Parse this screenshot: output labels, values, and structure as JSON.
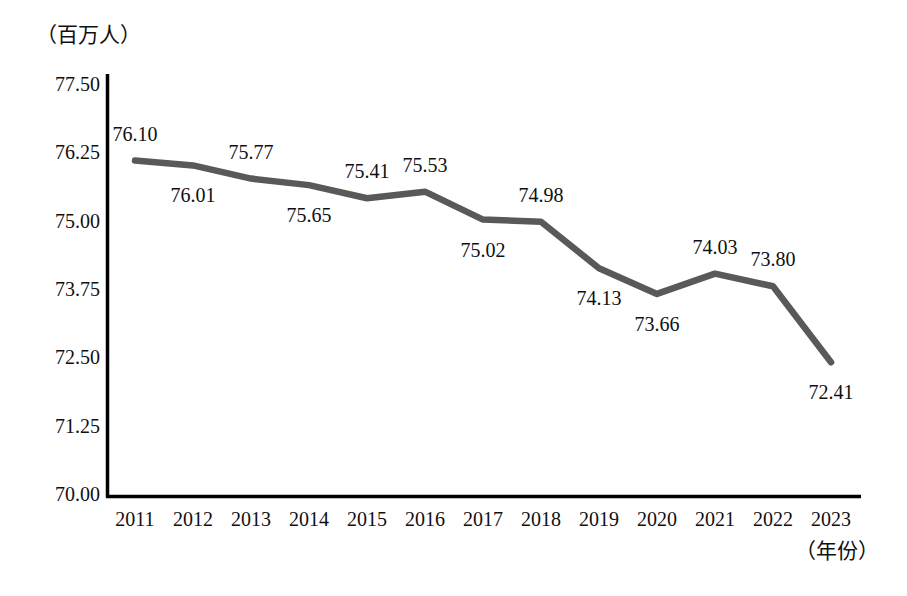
{
  "chart_data": {
    "type": "line",
    "title": "",
    "subtitle": "",
    "ylabel": "（百万人）",
    "xlabel": "（年份）",
    "categories": [
      "2011",
      "2012",
      "2013",
      "2014",
      "2015",
      "2016",
      "2017",
      "2018",
      "2019",
      "2020",
      "2021",
      "2022",
      "2023"
    ],
    "values": [
      76.1,
      76.01,
      75.77,
      75.65,
      75.41,
      75.53,
      75.02,
      74.98,
      74.13,
      73.66,
      74.03,
      73.8,
      72.41
    ],
    "point_labels": [
      "76.10",
      "76.01",
      "75.77",
      "75.65",
      "75.41",
      "75.53",
      "75.02",
      "74.98",
      "74.13",
      "73.66",
      "74.03",
      "73.80",
      "72.41"
    ],
    "label_positions": [
      "above",
      "below",
      "above",
      "below",
      "above",
      "above",
      "below",
      "above",
      "below",
      "below",
      "above",
      "above",
      "below"
    ],
    "ylim": [
      70.0,
      77.5
    ],
    "ytick_labels": [
      "77.50",
      "76.25",
      "75.00",
      "73.75",
      "72.50",
      "71.25",
      "70.00"
    ],
    "ytick_values": [
      77.5,
      76.25,
      75.0,
      73.75,
      72.5,
      71.25,
      70.0
    ],
    "grid": false,
    "legend": false,
    "series_color": "#595959",
    "axis_color": "#000000",
    "line_width": 6
  }
}
